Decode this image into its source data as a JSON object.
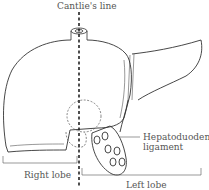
{
  "diagram": {
    "labels": {
      "cantlie_line": "Cantlie's line",
      "hepatoduodenal_1": "Hepatoduodenal",
      "hepatoduodenal_2": "ligament",
      "right_lobe": "Right lobe",
      "left_lobe": "Left lobe"
    },
    "colors": {
      "stroke": "#333333",
      "label": "#555555",
      "background": "#ffffff"
    }
  }
}
